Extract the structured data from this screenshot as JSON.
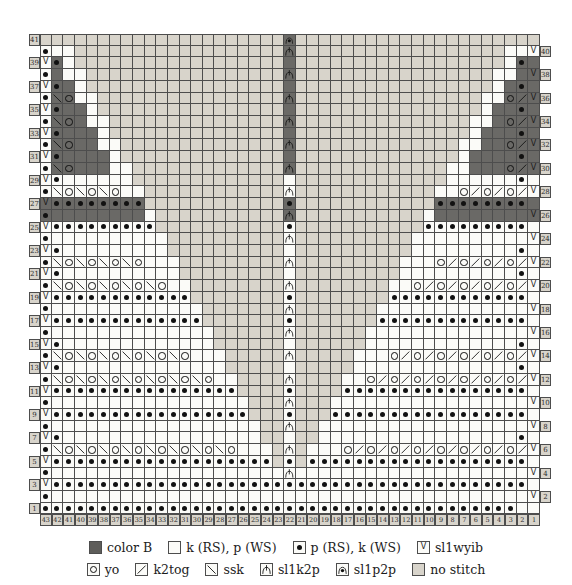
{
  "chart": {
    "stitch_count": 43,
    "row_count": 41,
    "left_row_labels": [
      41,
      39,
      37,
      35,
      33,
      31,
      29,
      27,
      25,
      23,
      21,
      19,
      17,
      15,
      13,
      11,
      9,
      7,
      5,
      3,
      1
    ],
    "right_row_labels": [
      40,
      38,
      36,
      34,
      32,
      30,
      28,
      26,
      24,
      22,
      20,
      18,
      16,
      14,
      12,
      10,
      8,
      6,
      4,
      2
    ],
    "col_numbers": [
      43,
      42,
      41,
      40,
      39,
      38,
      37,
      36,
      35,
      34,
      33,
      32,
      31,
      30,
      29,
      28,
      27,
      26,
      25,
      24,
      23,
      22,
      21,
      20,
      19,
      18,
      17,
      16,
      15,
      14,
      13,
      12,
      11,
      10,
      9,
      8,
      7,
      6,
      5,
      4,
      3,
      2,
      1
    ],
    "cell_codes_key": {
      ".": "knit (white)",
      "-": "no stitch (tan)",
      "B": "color B empty (dark)",
      "P": "purl dot on white",
      "Q": "purl dot on dark",
      "V": "sl1wyib on white",
      "W": "sl1wyib on dark",
      "O": "yo on white",
      "N": "yo on dark",
      "k": "k2tog on white",
      "K": "k2tog on dark",
      "s": "ssk on white",
      "L": "ssk on dark",
      "A": "sl1k2p on white",
      "C": "sl1k2p on dark",
      "D": "sl1p2p on dark",
      "E": "sl1p2p on white"
    },
    "rows": [
      "---------------------D---------------------",
      "P..------------------C------------------..V",
      "VQ.------------------B------------------.QB",
      "PB..-----------------C-----------------..BW",
      "VQB.-----------------B-----------------.BQB",
      "PLN..----------------C----------------..NKW",
      "VQBB.----------------B----------------.BBQB",
      "PLNB..---------------C---------------..BNKW",
      "VQBBB.---------------B---------------.BBBQB",
      "PLNBB..--------------C--------------..BBNKW",
      "VQBBBB.--------------B--------------.BBBBQB",
      "PLNBBB..-------------C-------------..BBBNKW",
      "VP......-------------.-------------......P.",
      "PsOsOsO..------------A------------..OkOkOkV",
      "WQQQQQQQQ------------Q------------QQQQQQQQB",
      "QBBBBBBBB.-----------C-----------.BBBBBBBBW",
      "VPPPPPPPPP-----------P-----------PPPPPPPPP.",
      "P..........----------A----------..........V",
      "VP.........----------.----------.........P.",
      "PsOsOsOsO...---------A---------...OkOkOkOkV",
      "VP..........---------.---------..........P.",
      "PsOsOsOsOsO..--------A--------..OkOkOkOkOkV",
      "VPPPPPPPPPPPP--------P--------PPPPPPPPPPPP.",
      "P.............-------A-------.............V",
      "VPPPPPPPPPPPPP-------P-------PPPPPPPPPPPPP.",
      "P..............------A------..............V",
      "VP.............------.------.............P.",
      "PsOsOsOsOsOsO...-----A-----...OkOkOkOkOkOkV",
      "VP..............-----.-----..............P.",
      "PsOsOsOsOsOsOsO..----A----..OkOkOkOkOkOkOkV",
      "VPPPPPPPPPPPPPPPP----P----PPPPPPPPPPPPPPPP.",
      "P.................---A---.................V",
      "VPPPPPPPPPPPPPPPPP---P---PPPPPPPPPPPPPPPPP.",
      "P..................--A--..................V",
      "VP.................--.--.................P.",
      "PsOsOsOsOsOsOsOsO...-A-...OkOkOkOkOkOkOkOkV",
      "VPPPPPPPPPPPPPPPPPPP-P-PPPPPPPPPPPPPPPPPPP.",
      "P....................A....................V",
      "VPPPPPPPPPPPPPPPPPPPPPPPPPPPPPPPPPPPPPPPPP.",
      "P.........................................V",
      "PPPPPPPPPPPPPPPPPPPPPPPPPPPPPPPPPPPPPPPPP."
    ]
  },
  "legend": {
    "row1": [
      {
        "code": "B",
        "label": "color B"
      },
      {
        "code": ".",
        "label": "k (RS), p (WS)"
      },
      {
        "code": "P",
        "label": "p (RS), k (WS)"
      },
      {
        "code": "V",
        "label": "sl1wyib"
      }
    ],
    "row2": [
      {
        "code": "O",
        "label": "yo"
      },
      {
        "code": "k",
        "label": "k2tog"
      },
      {
        "code": "s",
        "label": "ssk"
      },
      {
        "code": "A",
        "label": "sl1k2p"
      },
      {
        "code": "E",
        "label": "sl1p2p"
      },
      {
        "code": "-",
        "label": "no stitch"
      }
    ]
  },
  "colors": {
    "white_cell": "#fbfbf8",
    "no_stitch": "#d8d4cb",
    "color_b": "#6a6966",
    "grid_line": "#4d4d4d",
    "symbol": "#111111"
  }
}
